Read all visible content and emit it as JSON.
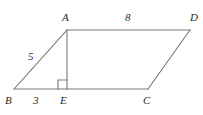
{
  "figure": {
    "background_color": "#ffffff",
    "stroke_color": "#7a7a7a",
    "text_color": "#2b2b2b"
  },
  "vertices": [
    {
      "name": "A",
      "label": "A",
      "x": 67,
      "y": 30,
      "label_x": 62,
      "label_y": 12
    },
    {
      "name": "B",
      "label": "B",
      "x": 14,
      "y": 89,
      "label_x": 5,
      "label_y": 95
    },
    {
      "name": "C",
      "label": "C",
      "x": 148,
      "y": 89,
      "label_x": 143,
      "label_y": 95
    },
    {
      "name": "D",
      "label": "D",
      "x": 190,
      "y": 30,
      "label_x": 190,
      "label_y": 12
    },
    {
      "name": "E",
      "label": "E",
      "x": 67,
      "y": 89,
      "label_x": 60,
      "label_y": 95
    }
  ],
  "segments": [
    {
      "name": "segment-AD",
      "from": "A",
      "to": "D"
    },
    {
      "name": "segment-BC",
      "from": "B",
      "to": "C"
    },
    {
      "name": "segment-BA",
      "from": "B",
      "to": "A"
    },
    {
      "name": "segment-CD",
      "from": "C",
      "to": "D"
    },
    {
      "name": "segment-AE",
      "from": "A",
      "to": "E"
    }
  ],
  "measures": [
    {
      "name": "length-BA",
      "segment": "BA",
      "value": "5",
      "x": 28,
      "y": 51
    },
    {
      "name": "length-BE",
      "segment": "BE",
      "value": "3",
      "x": 33,
      "y": 95
    },
    {
      "name": "length-AD",
      "segment": "AD",
      "value": "8",
      "x": 125,
      "y": 12
    }
  ],
  "right_angle": {
    "name": "right-angle-marker-at-E",
    "at_vertex": "E",
    "x": 58,
    "y": 80,
    "size": 9
  }
}
